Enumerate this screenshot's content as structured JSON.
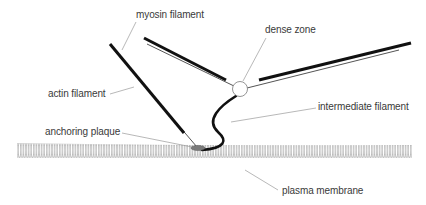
{
  "diagram": {
    "labels": {
      "myosin_filament": "myosin filament",
      "dense_zone": "dense zone",
      "actin_filament": "actin filament",
      "intermediate_filament": "intermediate filament",
      "anchoring_plaque": "anchoring plaque",
      "plasma_membrane": "plasma membrane"
    },
    "colors": {
      "filament": "#111111",
      "actin": "#555555",
      "leader": "#9a9a9a",
      "membrane": "#8c8c8c",
      "plaque": "#7a7a7a",
      "dense_zone": "#ffffff"
    }
  }
}
